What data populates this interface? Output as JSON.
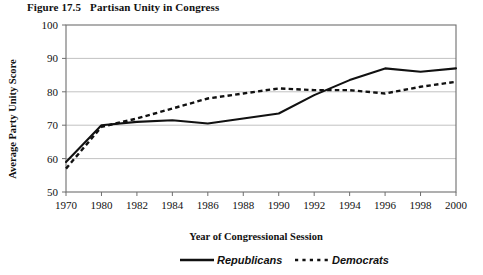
{
  "figure": {
    "number": "Figure 17.5",
    "title": "Partisan Unity in Congress"
  },
  "chart_data": {
    "type": "line",
    "title": "Partisan Unity in Congress",
    "xlabel": "Year of Congressional Session",
    "ylabel": "Average Party Unity Score",
    "categories": [
      "1970",
      "1980",
      "1982",
      "1984",
      "1986",
      "1988",
      "1990",
      "1992",
      "1994",
      "1996",
      "1998",
      "2000"
    ],
    "x_tick_labels": [
      "1970",
      "1980",
      "1982",
      "1984",
      "1986",
      "1988",
      "1990",
      "1992",
      "1994",
      "1996",
      "1998",
      "2000"
    ],
    "y_tick_labels": [
      "50",
      "60",
      "70",
      "80",
      "90",
      "100"
    ],
    "ylim": [
      50,
      100
    ],
    "y_ticks": [
      50,
      60,
      70,
      80,
      90,
      100
    ],
    "grid": true,
    "grid_axis": "y",
    "legend_position": "bottom",
    "series": [
      {
        "name": "Republicans",
        "style": "solid",
        "color": "#111111",
        "values": [
          59,
          70,
          71,
          71.5,
          70.5,
          72,
          73.5,
          79,
          83.5,
          87,
          86,
          87
        ]
      },
      {
        "name": "Democrats",
        "style": "dashed",
        "color": "#111111",
        "values": [
          57,
          69.5,
          72,
          75,
          78,
          79.5,
          81,
          80.5,
          80.5,
          79.5,
          81.5,
          83
        ]
      }
    ]
  },
  "legend": {
    "items": [
      {
        "label": "Republicans",
        "style": "solid"
      },
      {
        "label": "Democrats",
        "style": "dashed"
      }
    ]
  }
}
